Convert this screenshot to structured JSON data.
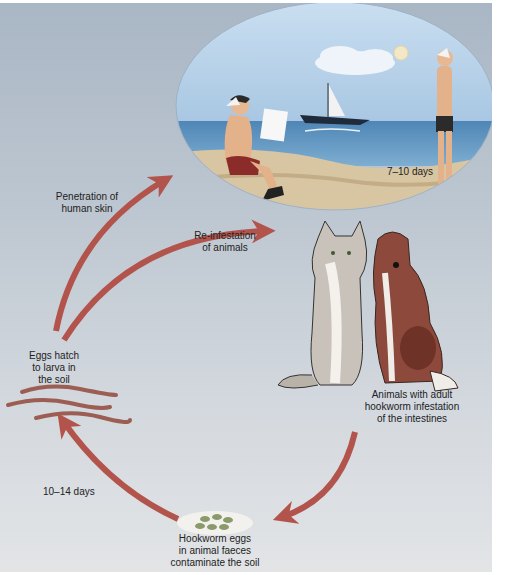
{
  "diagram": {
    "colors": {
      "arrow": "#b2544c",
      "background_top": "#a9b6c4",
      "background_bottom": "#e2e4e6",
      "sky": "#b9d3ea",
      "sea": "#5f93bd",
      "sand": "#d9c7a5"
    },
    "labels": {
      "penetration": [
        "Penetration of",
        "human skin"
      ],
      "reinfestation": [
        "Re-infestation",
        "of animals"
      ],
      "eggs_hatch": [
        "Eggs hatch",
        "to larva in",
        "the soil"
      ],
      "animals_adult": [
        "Animals with adult",
        "hookworm infestation",
        "of the intestines"
      ],
      "hookworm_eggs": [
        "Hookworm eggs",
        "in animal faeces",
        "contaminate the soil"
      ],
      "days_7_10": "7–10 days",
      "days_10_14": "10–14 days"
    },
    "stages": [
      {
        "id": "human-beach",
        "description": "Humans on beach"
      },
      {
        "id": "animals",
        "description": "Cat and dog"
      },
      {
        "id": "eggs",
        "description": "Hookworm eggs in faeces"
      },
      {
        "id": "larva",
        "description": "Larvae in the soil"
      }
    ]
  }
}
